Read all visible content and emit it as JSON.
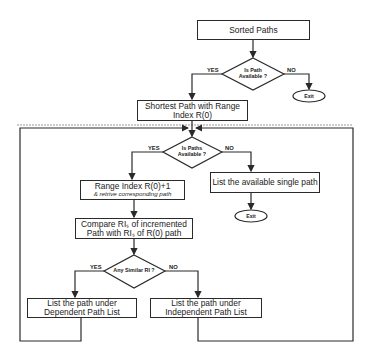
{
  "diagram": {
    "type": "flowchart",
    "nodes": {
      "sorted_paths": {
        "label": "Sorted Paths"
      },
      "decision_path_available": {
        "line1": "Is Path",
        "line2": "Available  ?",
        "yes": "YES",
        "no": "NO"
      },
      "exit_top": {
        "label": "Exit"
      },
      "shortest_path": {
        "line1": "Shortest Path with Range",
        "line2": "Index R(0)"
      },
      "decision_paths_available": {
        "line1": "Is Paths",
        "line2": "Available  ?",
        "yes": "YES",
        "no": "NO"
      },
      "range_index": {
        "line1": "Range Index R(0)+1",
        "line2": "& retrive corresponding path"
      },
      "list_single": {
        "label": "List the available single path"
      },
      "exit_mid": {
        "label": "Exit"
      },
      "compare": {
        "line1": "Compare RIₛ of incremented",
        "line2": "Path with RIₛ of R(0) path"
      },
      "decision_similar": {
        "line1": "Any Similar RI ?",
        "yes": "YES",
        "no": "NO"
      },
      "dependent": {
        "line1": "List the path under",
        "line2": "Dependent Path List"
      },
      "independent": {
        "line1": "List the path under",
        "line2": "Independent Path List"
      }
    },
    "edges": [
      {
        "from": "sorted_paths",
        "to": "decision_path_available"
      },
      {
        "from": "decision_path_available",
        "to": "shortest_path",
        "label": "YES"
      },
      {
        "from": "decision_path_available",
        "to": "exit_top",
        "label": "NO"
      },
      {
        "from": "shortest_path",
        "to": "decision_paths_available"
      },
      {
        "from": "decision_paths_available",
        "to": "range_index",
        "label": "YES"
      },
      {
        "from": "decision_paths_available",
        "to": "list_single",
        "label": "NO"
      },
      {
        "from": "list_single",
        "to": "exit_mid"
      },
      {
        "from": "range_index",
        "to": "compare"
      },
      {
        "from": "compare",
        "to": "decision_similar"
      },
      {
        "from": "decision_similar",
        "to": "dependent",
        "label": "YES"
      },
      {
        "from": "decision_similar",
        "to": "independent",
        "label": "NO"
      },
      {
        "from": "dependent",
        "to": "decision_paths_available",
        "label": "loop"
      },
      {
        "from": "independent",
        "to": "decision_paths_available",
        "label": "loop"
      }
    ],
    "colors": {
      "stroke": "#2a2a2a",
      "background": "#ffffff",
      "dashed": "#999999"
    }
  }
}
